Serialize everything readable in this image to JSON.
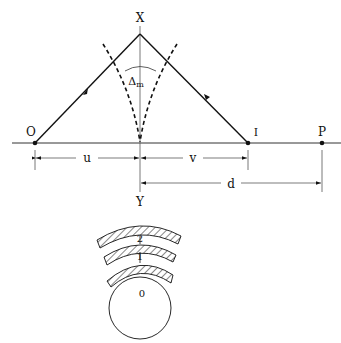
{
  "diagram": {
    "labels": {
      "apex": "X",
      "bottom": "Y",
      "object": "O",
      "image": "I",
      "point_p": "P",
      "object_distance": "u",
      "image_distance": "v",
      "distance_d": "d",
      "deviation_symbol": "Δ",
      "deviation_subscript": "m"
    },
    "layers": {
      "core": "0",
      "layer1": "1",
      "layer2": "2"
    },
    "colors": {
      "stroke": "#111111",
      "background": "#ffffff"
    }
  }
}
